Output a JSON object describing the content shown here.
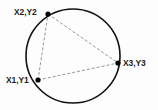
{
  "diagram": {
    "background_color": "#fdfdfd",
    "circle": {
      "name": "circumcircle",
      "center_x": 73,
      "center_y": 56,
      "radius": 47,
      "stroke_color": "#111111",
      "stroke_width": 1.6,
      "fill": "none"
    },
    "points": [
      {
        "id": "p1",
        "label": "X1,Y1",
        "x": 38,
        "y": 80,
        "marker_color": "#000000",
        "marker_radius": 2.6,
        "label_position": "left"
      },
      {
        "id": "p2",
        "label": "X2,Y2",
        "x": 48,
        "y": 14,
        "marker_color": "#000000",
        "marker_radius": 2.6,
        "label_position": "left"
      },
      {
        "id": "p3",
        "label": "X3,Y3",
        "x": 118,
        "y": 63,
        "marker_color": "#000000",
        "marker_radius": 2.6,
        "label_position": "right"
      }
    ],
    "chords": [
      {
        "id": "chord-p1-p2",
        "from": "p1",
        "to": "p2"
      },
      {
        "id": "chord-p2-p3",
        "from": "p2",
        "to": "p3"
      },
      {
        "id": "chord-p1-p3",
        "from": "p1",
        "to": "p3"
      }
    ],
    "chord_style": {
      "stroke_color": "#8a8a8a",
      "stroke_width": 0.9,
      "dash_pattern": "3 2"
    }
  }
}
